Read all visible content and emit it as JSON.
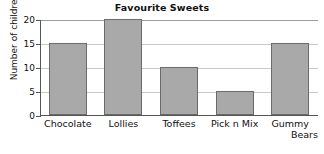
{
  "chart_data": {
    "type": "bar",
    "title": "Favourite Sweets",
    "xlabel": "",
    "ylabel": "Number of children",
    "categories": [
      "Chocolate",
      "Lollies",
      "Toffees",
      "Pick n Mix",
      "Gummy Bears"
    ],
    "values": [
      15,
      20,
      10,
      5,
      15
    ],
    "ylim": [
      0,
      20
    ],
    "yticks": [
      0,
      5,
      10,
      15,
      20
    ],
    "ytick_labels": [
      "0",
      "5",
      "10",
      "15",
      "20"
    ],
    "grid": true,
    "legend": null,
    "colors": {
      "bar_fill": "#a9a9a9",
      "bar_stroke": "#6b6b6b",
      "gridline": "#c9c9c9",
      "axis": "#555555",
      "text": "#111111",
      "background": "#ffffff"
    }
  },
  "category_label_lines": [
    [
      "Chocolate"
    ],
    [
      "Lollies"
    ],
    [
      "Toffees"
    ],
    [
      "Pick n Mix"
    ],
    [
      "Gummy",
      "Bears"
    ]
  ]
}
